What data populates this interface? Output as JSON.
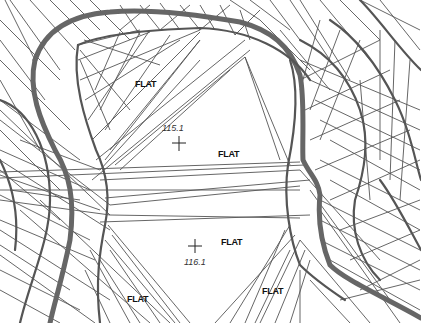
{
  "figure": {
    "type": "TIN surface with contour lines",
    "colors": {
      "background": "#ffffff",
      "lines": "#555555",
      "major_contour": "#666666",
      "text": "#111111"
    }
  },
  "labels": {
    "flat": [
      {
        "text": "FLAT",
        "x": 135,
        "y": 84
      },
      {
        "text": "FLAT",
        "x": 218,
        "y": 157
      },
      {
        "text": "FLAT",
        "x": 221,
        "y": 245
      },
      {
        "text": "FLAT",
        "x": 127,
        "y": 301
      },
      {
        "text": "FLAT",
        "x": 262,
        "y": 294
      }
    ],
    "spot_elevations": [
      {
        "text": "115.1",
        "cross_x": 179,
        "cross_y": 143,
        "text_x": 162,
        "text_y": 131
      },
      {
        "text": "116.1",
        "cross_x": 195,
        "cross_y": 246,
        "text_x": 184,
        "text_y": 265
      }
    ]
  }
}
